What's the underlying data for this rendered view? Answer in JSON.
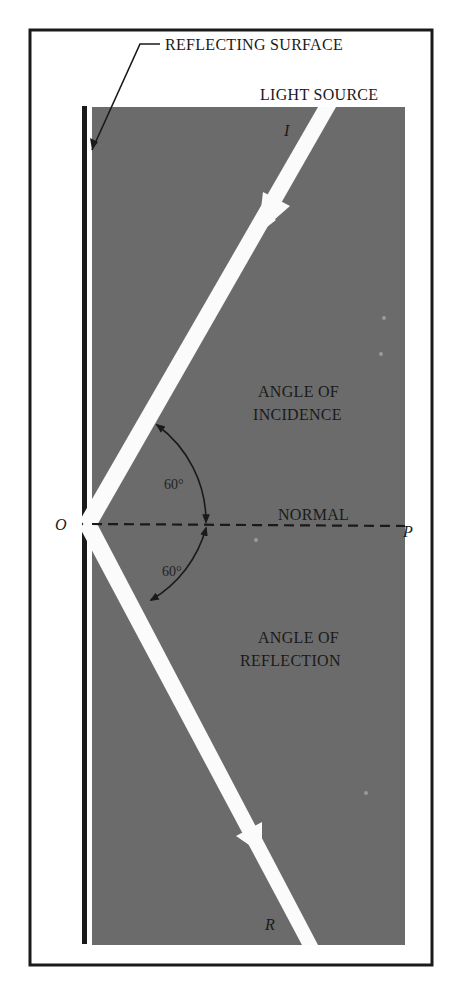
{
  "figure": {
    "labels": {
      "reflecting_surface": "REFLECTING SURFACE",
      "light_source": "LIGHT SOURCE",
      "incident_ray": "I",
      "reflected_ray": "R",
      "point_o": "O",
      "point_p": "P",
      "normal": "NORMAL",
      "angle_incidence_line1": "ANGLE OF",
      "angle_incidence_line2": "INCIDENCE",
      "angle_reflection_line1": "ANGLE OF",
      "angle_reflection_line2": "REFLECTION",
      "angle_incidence_value": "60°",
      "angle_reflection_value": "60°"
    },
    "angles": {
      "incidence_deg": 60,
      "reflection_deg": 60
    },
    "colors": {
      "background_panel": "#6b6b6b",
      "rays": "#fbfbfb",
      "frame": "#1a1a1a",
      "surface": "#1a1a1a",
      "page": "#ffffff"
    }
  }
}
